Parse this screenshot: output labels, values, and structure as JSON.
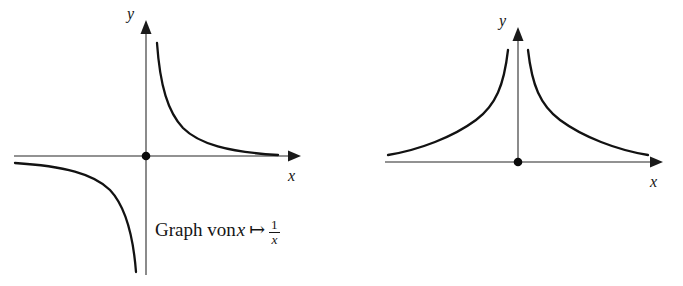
{
  "figure": {
    "background_color": "#ffffff",
    "axis_color": "#6e6e6e",
    "curve_color": "#121212",
    "text_color": "#151515",
    "panels": [
      {
        "id": "left",
        "caption": {
          "prefix": "Graph von",
          "variable": "x",
          "maps_to_symbol": "↦",
          "fraction_numerator": "1",
          "fraction_denominator": "x",
          "fraction_denominator_exponent": "",
          "full_text": "Graph von x ↦ 1/x"
        },
        "axes": {
          "x_label": "x",
          "y_label": "y",
          "origin_marker": "dot"
        },
        "chart": {
          "type": "line",
          "function": "1/x",
          "title": "Graph von x ↦ 1/x",
          "xlabel": "x",
          "ylabel": "y",
          "grid": false,
          "legend": "none",
          "branches": [
            {
              "name": "x > 0",
              "x": [
                0.35,
                0.4,
                0.45,
                0.5,
                0.6,
                0.7,
                0.85,
                1.0,
                1.25,
                1.5,
                1.75,
                2.0,
                2.5,
                3.0,
                3.5,
                4.0
              ],
              "y": [
                2.86,
                2.5,
                2.22,
                2.0,
                1.67,
                1.43,
                1.18,
                1.0,
                0.8,
                0.67,
                0.57,
                0.5,
                0.4,
                0.33,
                0.29,
                0.25
              ]
            },
            {
              "name": "x < 0",
              "x": [
                -4.0,
                -3.5,
                -3.0,
                -2.5,
                -2.0,
                -1.75,
                -1.5,
                -1.25,
                -1.0,
                -0.85,
                -0.7,
                -0.6,
                -0.5,
                -0.45,
                -0.4,
                -0.35
              ],
              "y": [
                -0.25,
                -0.29,
                -0.33,
                -0.4,
                -0.5,
                -0.57,
                -0.67,
                -0.8,
                -1.0,
                -1.18,
                -1.43,
                -1.67,
                -2.0,
                -2.22,
                -2.5,
                -2.86
              ]
            }
          ]
        }
      },
      {
        "id": "right",
        "caption": {
          "prefix": "Graph von",
          "variable": "x",
          "maps_to_symbol": "↦",
          "fraction_numerator": "1",
          "fraction_denominator": "x",
          "fraction_denominator_exponent": "2",
          "full_text": "Graph von x ↦ 1/x²"
        },
        "axes": {
          "x_label": "x",
          "y_label": "y",
          "origin_marker": "dot"
        },
        "chart": {
          "type": "line",
          "function": "1/x^2",
          "title": "Graph von x ↦ 1/x²",
          "xlabel": "x",
          "ylabel": "y",
          "grid": false,
          "legend": "none",
          "branches": [
            {
              "name": "x > 0",
              "x": [
                0.6,
                0.7,
                0.8,
                0.9,
                1.0,
                1.2,
                1.4,
                1.6,
                1.9,
                2.2,
                2.6,
                3.0,
                3.6,
                4.2,
                5.0
              ],
              "y": [
                2.78,
                2.04,
                1.56,
                1.23,
                1.0,
                0.69,
                0.51,
                0.39,
                0.28,
                0.21,
                0.15,
                0.11,
                0.08,
                0.06,
                0.04
              ]
            },
            {
              "name": "x < 0",
              "x": [
                -5.0,
                -4.2,
                -3.6,
                -3.0,
                -2.6,
                -2.2,
                -1.9,
                -1.6,
                -1.4,
                -1.2,
                -1.0,
                -0.9,
                -0.8,
                -0.7,
                -0.6
              ],
              "y": [
                0.04,
                0.06,
                0.08,
                0.11,
                0.15,
                0.21,
                0.28,
                0.39,
                0.51,
                0.69,
                1.0,
                1.23,
                1.56,
                2.04,
                2.78
              ]
            }
          ]
        }
      }
    ]
  }
}
